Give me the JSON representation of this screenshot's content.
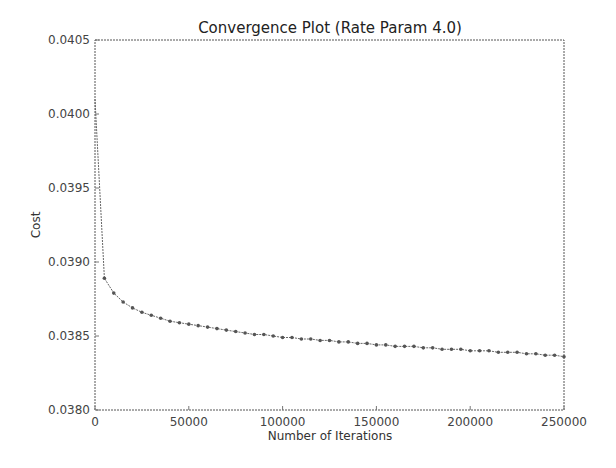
{
  "chart_data": {
    "type": "line",
    "title": "Convergence Plot (Rate Param 4.0)",
    "xlabel": "Number of Iterations",
    "ylabel": "Cost",
    "xlim": [
      0,
      250000
    ],
    "ylim": [
      0.038,
      0.0405
    ],
    "xticks": [
      "0",
      "50000",
      "100000",
      "150000",
      "200000",
      "250000"
    ],
    "yticks": [
      "0.0380",
      "0.0385",
      "0.0390",
      "0.0395",
      "0.0400",
      "0.0405"
    ],
    "grid": false,
    "legend": null,
    "series": [
      {
        "name": "cost",
        "marker": "dot",
        "color": "#555555",
        "x": [
          0,
          5000,
          10000,
          15000,
          20000,
          25000,
          30000,
          35000,
          40000,
          45000,
          50000,
          55000,
          60000,
          65000,
          70000,
          75000,
          80000,
          85000,
          90000,
          95000,
          100000,
          105000,
          110000,
          115000,
          120000,
          125000,
          130000,
          135000,
          140000,
          145000,
          150000,
          155000,
          160000,
          165000,
          170000,
          175000,
          180000,
          185000,
          190000,
          195000,
          200000,
          205000,
          210000,
          215000,
          220000,
          225000,
          230000,
          235000,
          240000,
          245000,
          250000
        ],
        "y": [
          0.0401,
          0.03889,
          0.03879,
          0.03873,
          0.03869,
          0.03866,
          0.03864,
          0.03862,
          0.0386,
          0.03859,
          0.03858,
          0.03857,
          0.03856,
          0.03855,
          0.03854,
          0.03853,
          0.03852,
          0.03851,
          0.03851,
          0.0385,
          0.03849,
          0.03849,
          0.03848,
          0.03848,
          0.03847,
          0.03847,
          0.03846,
          0.03846,
          0.03845,
          0.03845,
          0.03844,
          0.03844,
          0.03843,
          0.03843,
          0.03843,
          0.03842,
          0.03842,
          0.03841,
          0.03841,
          0.03841,
          0.0384,
          0.0384,
          0.0384,
          0.03839,
          0.03839,
          0.03839,
          0.03838,
          0.03838,
          0.03837,
          0.03837,
          0.03836
        ]
      }
    ]
  }
}
